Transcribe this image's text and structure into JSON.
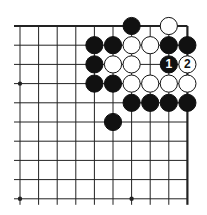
{
  "board": {
    "type": "go-diagram",
    "corner": "top-right",
    "cols": 10,
    "rows": 10,
    "origin_x": 20,
    "origin_y": 26,
    "spacing_x": 18.6,
    "spacing_y": 19.2,
    "stone_radius": 8.6,
    "edges": {
      "top": true,
      "right": true
    },
    "colors": {
      "black": "#111111",
      "white": "#ffffff",
      "line": "#222222",
      "background": "#ffffff"
    },
    "star_points": [
      {
        "col": 0,
        "row": 3
      },
      {
        "col": 0,
        "row": 9
      },
      {
        "col": 6,
        "row": 9
      }
    ],
    "stones": [
      {
        "col": 6,
        "row": 0,
        "color": "black",
        "label": ""
      },
      {
        "col": 8,
        "row": 0,
        "color": "white",
        "label": ""
      },
      {
        "col": 4,
        "row": 1,
        "color": "black",
        "label": ""
      },
      {
        "col": 5,
        "row": 1,
        "color": "black",
        "label": ""
      },
      {
        "col": 6,
        "row": 1,
        "color": "white",
        "label": ""
      },
      {
        "col": 7,
        "row": 1,
        "color": "white",
        "label": ""
      },
      {
        "col": 8,
        "row": 1,
        "color": "black",
        "label": ""
      },
      {
        "col": 9,
        "row": 1,
        "color": "black",
        "label": ""
      },
      {
        "col": 4,
        "row": 2,
        "color": "black",
        "label": ""
      },
      {
        "col": 5,
        "row": 2,
        "color": "white",
        "label": ""
      },
      {
        "col": 6,
        "row": 2,
        "color": "white",
        "label": ""
      },
      {
        "col": 8,
        "row": 2,
        "color": "black",
        "label": "1"
      },
      {
        "col": 9,
        "row": 2,
        "color": "white",
        "label": "2"
      },
      {
        "col": 4,
        "row": 3,
        "color": "black",
        "label": ""
      },
      {
        "col": 5,
        "row": 3,
        "color": "black",
        "label": ""
      },
      {
        "col": 6,
        "row": 3,
        "color": "white",
        "label": ""
      },
      {
        "col": 7,
        "row": 3,
        "color": "white",
        "label": ""
      },
      {
        "col": 8,
        "row": 3,
        "color": "white",
        "label": ""
      },
      {
        "col": 9,
        "row": 3,
        "color": "white",
        "label": ""
      },
      {
        "col": 6,
        "row": 4,
        "color": "black",
        "label": ""
      },
      {
        "col": 7,
        "row": 4,
        "color": "black",
        "label": ""
      },
      {
        "col": 8,
        "row": 4,
        "color": "black",
        "label": ""
      },
      {
        "col": 9,
        "row": 4,
        "color": "black",
        "label": ""
      },
      {
        "col": 5,
        "row": 5,
        "color": "black",
        "label": ""
      }
    ]
  }
}
